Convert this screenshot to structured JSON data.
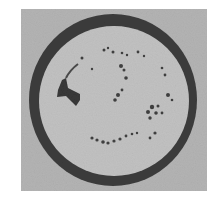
{
  "image": {
    "description": "Grayscale micrograph of a circular specimen with a thick dark ring and scattered dark deposits inside",
    "colors": {
      "background": "#ffffff",
      "field": "#b4b4b4",
      "interior": "#c2c2c2",
      "ring": "#3c3c3c",
      "deposits": "#404040"
    }
  }
}
